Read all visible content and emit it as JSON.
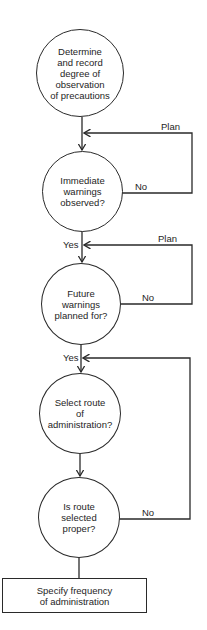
{
  "diagram": {
    "type": "flowchart",
    "nodes": [
      {
        "id": "n1",
        "shape": "circle",
        "text": "Determine\nand record\ndegree of\nobservation\nof precautions"
      },
      {
        "id": "n2",
        "shape": "circle",
        "text": "Immediate\nwarnings\nobserved?"
      },
      {
        "id": "n3",
        "shape": "circle",
        "text": "Future\nwarnings\nplanned for?"
      },
      {
        "id": "n4",
        "shape": "circle",
        "text": "Select route\nof\nadministration?"
      },
      {
        "id": "n5",
        "shape": "circle",
        "text": "Is route\nselected\nproper?"
      },
      {
        "id": "n6",
        "shape": "rectangle",
        "text": "Specify frequency\nof administration"
      }
    ],
    "edges": [
      {
        "from": "n1",
        "to": "n2",
        "label": ""
      },
      {
        "from": "n2",
        "to": "n2",
        "label_exit": "No",
        "label_return": "Plan"
      },
      {
        "from": "n2",
        "to": "n3",
        "label": "Yes"
      },
      {
        "from": "n3",
        "to": "n3",
        "label_exit": "No",
        "label_return": "Plan"
      },
      {
        "from": "n3",
        "to": "n4",
        "label": "Yes"
      },
      {
        "from": "n4",
        "to": "n5",
        "label": ""
      },
      {
        "from": "n5",
        "to": "n4",
        "label": "No"
      },
      {
        "from": "n5",
        "to": "n6",
        "label": ""
      }
    ],
    "labels": {
      "plan_1": "Plan",
      "no_1": "No",
      "yes_1": "Yes",
      "plan_2": "Plan",
      "no_2": "No",
      "yes_2": "Yes",
      "no_3": "No"
    }
  }
}
